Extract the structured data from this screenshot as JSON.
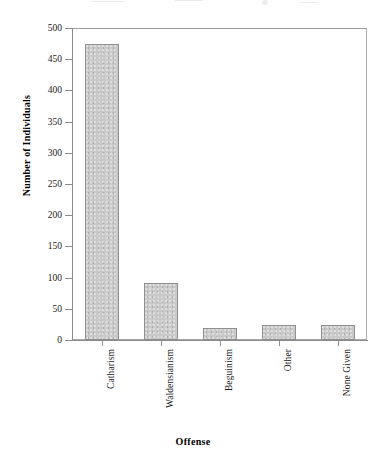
{
  "chart_data": {
    "type": "bar",
    "title": "",
    "xlabel": "Offense",
    "ylabel": "Number of Individuals",
    "categories": [
      "Catharism",
      "Waldensianism",
      "Beguinism",
      "Other",
      "None Given"
    ],
    "values": [
      475,
      92,
      19,
      24,
      24
    ],
    "ylim": [
      0,
      500
    ],
    "ytick_values": [
      0,
      50,
      100,
      150,
      200,
      250,
      300,
      350,
      400,
      450,
      500
    ],
    "ytick_labels": [
      "0",
      "50",
      "100",
      "150",
      "200",
      "250",
      "300",
      "350",
      "400",
      "450",
      "500"
    ],
    "grid": false,
    "legend": null,
    "bar_fill_color": "#c9c9c9",
    "bar_border_color": "#8f8f8f",
    "axis_color": "#8c8c8c",
    "text_color": "#111111",
    "background_color": "#ffffff",
    "category_label_rotation": 90
  }
}
